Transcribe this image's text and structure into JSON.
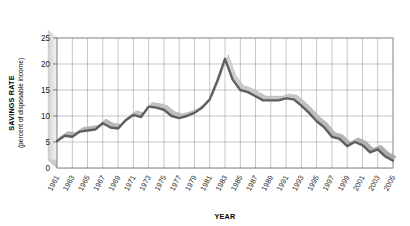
{
  "chart_data": {
    "type": "line",
    "title": "",
    "xlabel": "YEAR",
    "ylabel": "SAVINGS RATE",
    "ylabel_sub": "(percent of disposable income)",
    "ylim": [
      0,
      25
    ],
    "xlim": [
      1961,
      2005
    ],
    "ytick_labels": [
      "0",
      "5",
      "10",
      "15",
      "20",
      "25"
    ],
    "ytick_values": [
      0,
      5,
      10,
      15,
      20,
      25
    ],
    "xtick_labels": [
      "1961",
      "1963",
      "1965",
      "1967",
      "1969",
      "1971",
      "1973",
      "1975",
      "1977",
      "1979",
      "1981",
      "1983",
      "1985",
      "1987",
      "1989",
      "1991",
      "1993",
      "1995",
      "1997",
      "1999",
      "2001",
      "2003",
      "2005"
    ],
    "grid": true,
    "legend": "none",
    "style": "3d-ribbon",
    "series": [
      {
        "name": "Savings rate",
        "color": "#6b6b6b",
        "x": [
          1961,
          1962,
          1963,
          1964,
          1965,
          1966,
          1967,
          1968,
          1969,
          1970,
          1971,
          1972,
          1973,
          1974,
          1975,
          1976,
          1977,
          1978,
          1979,
          1980,
          1981,
          1982,
          1983,
          1984,
          1985,
          1986,
          1987,
          1988,
          1989,
          1990,
          1991,
          1992,
          1993,
          1994,
          1995,
          1996,
          1997,
          1998,
          1999,
          2000,
          2001,
          2002,
          2003,
          2004,
          2005
        ],
        "values": [
          5.2,
          6.2,
          6.0,
          7.0,
          7.2,
          7.4,
          8.6,
          7.8,
          7.6,
          9.2,
          10.2,
          9.8,
          11.8,
          11.6,
          11.2,
          10.0,
          9.6,
          10.0,
          10.6,
          11.6,
          13.2,
          16.8,
          21.0,
          17.0,
          15.0,
          14.6,
          13.8,
          13.0,
          13.0,
          13.0,
          13.4,
          13.2,
          12.0,
          10.6,
          9.0,
          7.8,
          6.0,
          5.6,
          4.2,
          5.0,
          4.4,
          3.0,
          3.6,
          2.2,
          1.4
        ]
      }
    ]
  },
  "annotations": {
    "peak_year": "1983",
    "peak_value": "21"
  }
}
